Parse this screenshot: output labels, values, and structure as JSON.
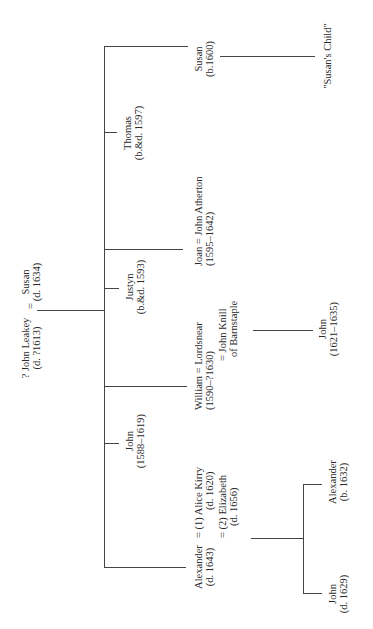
{
  "diagram": {
    "type": "family-tree",
    "orientation": "rotated-90-ccw",
    "parents": {
      "father": {
        "name": "? John Leakey",
        "dates": "(d. ?1613)"
      },
      "marriage_sign": "=",
      "mother": {
        "name": "Susan",
        "dates": "(d. 1634)"
      }
    },
    "children": [
      {
        "id": "alexander",
        "line1": "Alexander = (1) Alice Kirry",
        "line2": "(d. 1643)",
        "spouse1_dates": "(d. 1620)",
        "spouse2": "= (2) Elizabeth",
        "spouse2_dates": "(d. 1656)"
      },
      {
        "id": "john",
        "name": "John",
        "dates": "(1588–1619)"
      },
      {
        "id": "william",
        "line1": "William = Lordsnear",
        "line2": "(1590–?1630)",
        "line3": "= John Knill",
        "line4": "of Barnstaple"
      },
      {
        "id": "justyn",
        "name": "Justyn",
        "dates": "(b.&d. 1593)"
      },
      {
        "id": "joan",
        "line1": "Joan = John Atherton",
        "line2": "(1595–1642)"
      },
      {
        "id": "thomas",
        "name": "Thomas",
        "dates": "(b.&d. 1597)"
      },
      {
        "id": "susan",
        "name": "Susan",
        "dates": "(b.1600)"
      }
    ],
    "grandchildren": {
      "alexander": [
        {
          "name": "John",
          "dates": "(d. 1629)"
        },
        {
          "name": "Alexander",
          "dates": "(b. 1632)"
        }
      ],
      "william": [
        {
          "name": "John",
          "dates": "(1621–1635)"
        }
      ],
      "susan": [
        {
          "name": "\"Susan's Child\""
        }
      ]
    },
    "line_color": "#444444"
  }
}
